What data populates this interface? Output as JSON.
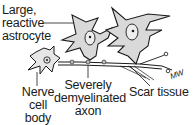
{
  "diagram": {
    "labels": {
      "astrocyte": [
        "Large,",
        "reactive",
        "astrocyte"
      ],
      "cell_body": [
        "Nerve",
        "cell",
        "body"
      ],
      "axon": [
        "Severely",
        "demyelinated",
        "axon"
      ],
      "scar": "Scar tissue"
    },
    "signature": "MW",
    "colors": {
      "ink": "#1a1a1a",
      "cell_fill": "#d9d9d9",
      "background": "#ffffff"
    }
  }
}
